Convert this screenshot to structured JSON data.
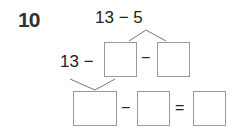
{
  "problem": {
    "number": "10",
    "expression": "13 − 5",
    "step1": {
      "prefix": "13 −",
      "minus": "−"
    },
    "step2": {
      "minus": "−",
      "equals": "="
    }
  },
  "colors": {
    "box_border": "#9a9a9a",
    "text": "#222222"
  }
}
